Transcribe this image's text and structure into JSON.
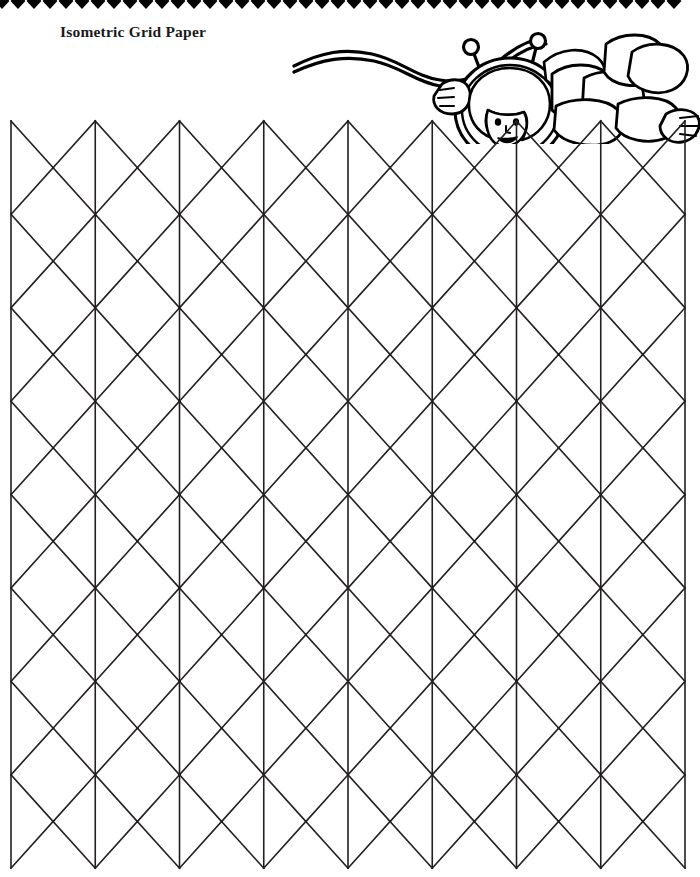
{
  "page": {
    "title": "Isometric Grid Paper",
    "background_color": "#ffffff",
    "ink_color": "#231f20",
    "width": 700,
    "height": 877
  },
  "border": {
    "name": "diamond-border",
    "shape": "diamond",
    "color": "#000000",
    "diamond_width": 16,
    "diamond_height": 16,
    "count": 43,
    "start_x": -6,
    "baseline_y": 1
  },
  "illustration": {
    "name": "astronaut-floating-with-tether",
    "description": "Line art of a child astronaut in a segmented space suit floating with two antennae and a wavy tether cord",
    "color": "#000000",
    "parts": [
      "tether-cord",
      "helmet",
      "antenna-left",
      "antenna-right",
      "face",
      "hair",
      "glove-left",
      "glove-right",
      "suit-torso",
      "suit-legs",
      "backpack"
    ]
  },
  "grid": {
    "name": "isometric-triangle-grid",
    "type": "isometric",
    "stroke_color": "#231f20",
    "stroke_width": 1.6,
    "origin_x": 11,
    "origin_y": 121,
    "half_width": 84.25,
    "row_height": 46.7,
    "columns": 8,
    "rows": 16,
    "left_edge_x": 11,
    "right_edge_x": 685,
    "top_y": 121,
    "bottom_y": 868
  }
}
